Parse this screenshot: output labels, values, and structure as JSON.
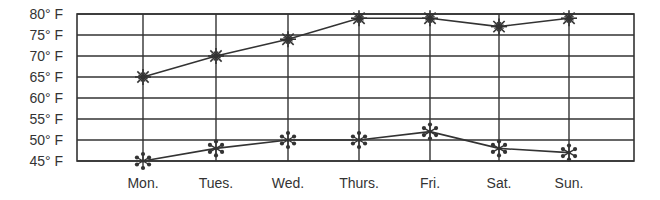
{
  "chart_data": {
    "type": "line",
    "title": "",
    "xlabel": "",
    "ylabel": "",
    "categories": [
      "Mon.",
      "Tues.",
      "Wed.",
      "Thurs.",
      "Fri.",
      "Sat.",
      "Sun."
    ],
    "y_ticks": [
      "80° F",
      "75° F",
      "70° F",
      "65° F",
      "60° F",
      "55° F",
      "50° F",
      "45° F"
    ],
    "y_tick_values": [
      80,
      75,
      70,
      65,
      60,
      55,
      50,
      45
    ],
    "ylim": [
      45,
      80
    ],
    "grid": true,
    "legend": null,
    "series": [
      {
        "name": "High temperature",
        "marker": "sun-star",
        "values": [
          65,
          70,
          74,
          79,
          79,
          77,
          79
        ]
      },
      {
        "name": "Low temperature",
        "marker": "snowflake",
        "values": [
          45,
          48,
          50,
          50,
          52,
          48,
          47
        ]
      }
    ]
  },
  "style": {
    "line_color": "#333333",
    "grid_color": "#333333"
  }
}
